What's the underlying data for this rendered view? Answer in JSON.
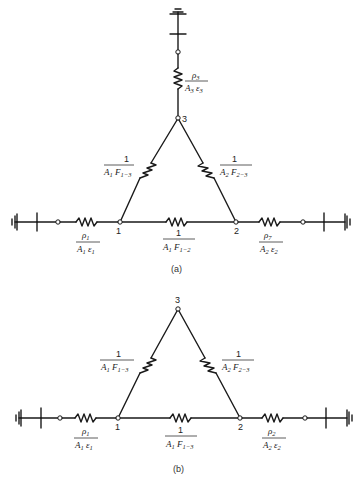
{
  "figure": {
    "panels": [
      {
        "caption": "(a)",
        "nodes": [
          {
            "id": "1",
            "label": "1"
          },
          {
            "id": "2",
            "label": "2"
          },
          {
            "id": "3",
            "label": "3"
          }
        ],
        "resistors": {
          "r1": {
            "num": "ρ",
            "num_sub": "1",
            "den_a": "A",
            "den_a_sub": "1",
            "den_b": "ε",
            "den_b_sub": "1"
          },
          "r2": {
            "num": "ρ",
            "num_sub": "7",
            "den_a": "A",
            "den_a_sub": "2",
            "den_b": "ε",
            "den_b_sub": "2"
          },
          "r3": {
            "num": "ρ",
            "num_sub": "3",
            "den_a": "A",
            "den_a_sub": "3",
            "den_b": "ε",
            "den_b_sub": "3"
          },
          "r13": {
            "num": "1",
            "den_a": "A",
            "den_a_sub": "1",
            "den_b": "F",
            "den_b_sub": "1−3"
          },
          "r23": {
            "num": "1",
            "den_a": "A",
            "den_a_sub": "2",
            "den_b": "F",
            "den_b_sub": "2−3"
          },
          "r12": {
            "num": "1",
            "den_a": "A",
            "den_a_sub": "1",
            "den_b": "F",
            "den_b_sub": "1−2"
          }
        }
      },
      {
        "caption": "(b)",
        "nodes": [
          {
            "id": "1",
            "label": "1"
          },
          {
            "id": "2",
            "label": "2"
          },
          {
            "id": "3",
            "label": "3"
          }
        ],
        "resistors": {
          "r1": {
            "num": "ρ",
            "num_sub": "1",
            "den_a": "A",
            "den_a_sub": "1",
            "den_b": "ε",
            "den_b_sub": "1"
          },
          "r2": {
            "num": "ρ",
            "num_sub": "2",
            "den_a": "A",
            "den_a_sub": "2",
            "den_b": "ε",
            "den_b_sub": "2"
          },
          "r13": {
            "num": "1",
            "den_a": "A",
            "den_a_sub": "1",
            "den_b": "F",
            "den_b_sub": "1−3"
          },
          "r23": {
            "num": "1",
            "den_a": "A",
            "den_a_sub": "2",
            "den_b": "F",
            "den_b_sub": "2−3"
          },
          "r12": {
            "num": "1",
            "den_a": "A",
            "den_a_sub": "1",
            "den_b": "F",
            "den_b_sub": "1−3"
          }
        }
      }
    ]
  }
}
